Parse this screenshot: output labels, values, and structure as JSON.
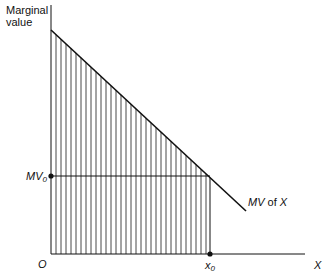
{
  "diagram": {
    "y_axis_label_line1": "Marginal",
    "y_axis_label_line2": "value",
    "x_axis_label": "X",
    "origin_label": "O",
    "mv0_label_main": "MV",
    "mv0_label_sub": "0",
    "x0_label_main": "x",
    "x0_label_sub": "0",
    "curve_label_mv": "MV",
    "curve_label_of": " of ",
    "curve_label_x": "X",
    "colors": {
      "line": "#111111",
      "hatch": "#333333",
      "background": "#ffffff"
    },
    "geometry": {
      "origin": [
        51,
        254
      ],
      "y_axis_top": 5,
      "x_axis_end": 305,
      "curve_start": [
        51,
        30
      ],
      "curve_end": [
        246,
        211
      ],
      "x0": 210,
      "mv0_y": 176,
      "hatch_spacing": 5
    }
  }
}
